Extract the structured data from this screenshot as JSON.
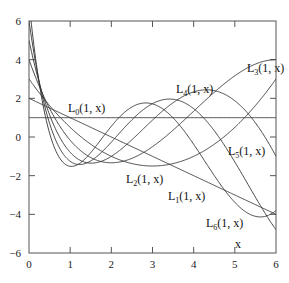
{
  "chart_data": {
    "type": "line",
    "title": "",
    "xlabel": "x",
    "ylabel": "",
    "xlim": [
      0,
      6
    ],
    "ylim": [
      -6,
      6
    ],
    "grid": false,
    "legend": "none (inline curve labels)",
    "x_ticks": [
      0,
      1,
      2,
      3,
      4,
      5,
      6
    ],
    "y_ticks": [
      -6,
      -4,
      -2,
      0,
      2,
      4,
      6
    ],
    "series": [
      {
        "name": "L0(1, x)",
        "label_main": "L",
        "label_sub": "0",
        "label_rest": "(1, x)",
        "coeffs": [
          1
        ],
        "denom": 1,
        "label_pos": [
          68,
          112
        ],
        "values_at_x": {
          "0": 1,
          "1": 1,
          "2": 1,
          "3": 1,
          "4": 1,
          "5": 1,
          "6": 1
        }
      },
      {
        "name": "L1(1, x)",
        "label_main": "L",
        "label_sub": "1",
        "label_rest": "(1, x)",
        "coeffs": [
          2,
          -1
        ],
        "denom": 1,
        "label_pos": [
          168,
          200
        ],
        "values_at_x": {
          "0": 2,
          "1": 1,
          "2": 0,
          "3": -1,
          "4": -2,
          "5": -3,
          "6": -4
        }
      },
      {
        "name": "L2(1, x)",
        "label_main": "L",
        "label_sub": "2",
        "label_rest": "(1, x)",
        "coeffs": [
          6,
          -6,
          1
        ],
        "denom": 2,
        "label_pos": [
          126,
          183
        ],
        "values_at_x": {
          "0": 3,
          "1": 0.5,
          "2": -1,
          "3": -1.5,
          "4": -1,
          "5": 0.5,
          "6": 3
        }
      },
      {
        "name": "L3(1, x)",
        "label_main": "L",
        "label_sub": "3",
        "label_rest": "(1, x)",
        "coeffs": [
          24,
          -36,
          12,
          -1
        ],
        "denom": 6,
        "label_pos": [
          247,
          72
        ],
        "values_at_x": {
          "0": 4,
          "1": -0.17,
          "2": -1.33,
          "3": -0.5,
          "4": 1.33,
          "5": 3.17,
          "6": 4
        }
      },
      {
        "name": "L4(1, x)",
        "label_main": "L",
        "label_sub": "4",
        "label_rest": "(1, x)",
        "coeffs": [
          120,
          -240,
          120,
          -20,
          1
        ],
        "denom": 24,
        "label_pos": [
          176,
          93
        ],
        "values_at_x": {
          "0": 5,
          "1": -0.79,
          "2": -1,
          "3": 0.88,
          "4": 1.67,
          "5": -0.21,
          "6": -3
        }
      },
      {
        "name": "L5(1, x)",
        "label_main": "L",
        "label_sub": "5",
        "label_rest": "(1, x)",
        "coeffs": [
          720,
          -1800,
          1200,
          -300,
          30,
          -1
        ],
        "denom": 120,
        "label_pos": [
          228,
          155
        ],
        "values_at_x": {
          "0": 6,
          "1": -1.24,
          "2": -0.27,
          "3": 1.58,
          "4": 0.13,
          "5": -2.29,
          "6": -0.8
        }
      },
      {
        "name": "L6(1, x)",
        "label_main": "L",
        "label_sub": "6",
        "label_rest": "(1, x)",
        "coeffs": [
          5040,
          -15120,
          12600,
          -4200,
          630,
          -42,
          1
        ],
        "denom": 720,
        "label_pos": [
          206,
          227
        ],
        "values_at_x": {
          "0": 7,
          "1": -1.49,
          "2": 0.6,
          "3": 1.71,
          "4": -1.49,
          "5": -1.67,
          "6": 2.2
        }
      }
    ],
    "annotations": [
      "x"
    ]
  },
  "plot_box": {
    "left": 29,
    "top": 21,
    "right": 276,
    "bottom": 253
  },
  "axis_label_x": "x",
  "axis_label_x_pos": [
    235,
    248
  ],
  "colors": {
    "frame": "#555555",
    "curve": "#333333",
    "text": "#222222",
    "background": "#ffffff"
  }
}
